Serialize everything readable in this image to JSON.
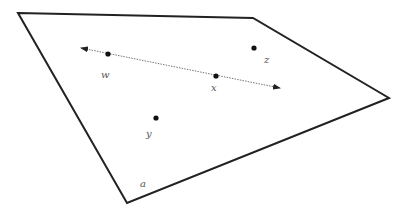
{
  "diagram": {
    "plane": {
      "label": "a",
      "vertices": [
        [
          18,
          13
        ],
        [
          253,
          18
        ],
        [
          389,
          98
        ],
        [
          127,
          203
        ]
      ],
      "stroke": "#222222"
    },
    "line": {
      "start": [
        81,
        48
      ],
      "end": [
        280,
        88
      ],
      "stroke": "#777777",
      "style": "dotted",
      "arrows": "both"
    },
    "points": [
      {
        "id": "w",
        "label": "w",
        "x": 108,
        "y": 54,
        "label_x": 101,
        "label_y": 78,
        "on_line": true
      },
      {
        "id": "x",
        "label": "x",
        "x": 216,
        "y": 76,
        "label_x": 211,
        "label_y": 91,
        "on_line": true
      },
      {
        "id": "z",
        "label": "z",
        "x": 254,
        "y": 48,
        "label_x": 264,
        "label_y": 63,
        "on_line": false
      },
      {
        "id": "y",
        "label": "y",
        "x": 156,
        "y": 118,
        "label_x": 146,
        "label_y": 137,
        "on_line": false
      }
    ],
    "point_color": "#111111"
  }
}
